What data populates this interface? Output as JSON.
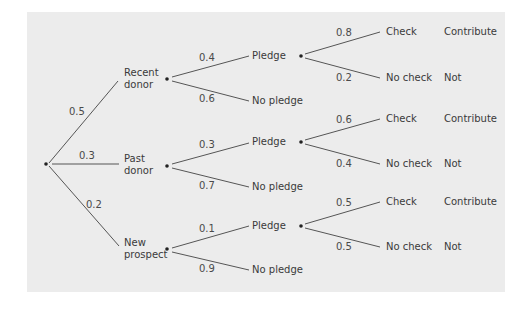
{
  "diagram": {
    "type": "probability-tree",
    "background_color": "#ececec",
    "line_color": "#555555",
    "level1": [
      {
        "label_line1": "Recent",
        "label_line2": "donor",
        "prob": "0.5"
      },
      {
        "label_line1": "Past",
        "label_line2": "donor",
        "prob": "0.3"
      },
      {
        "label_line1": "New",
        "label_line2": "prospect",
        "prob": "0.2"
      }
    ],
    "level2": [
      {
        "pledge": "Pledge",
        "pledge_prob": "0.4",
        "no_pledge": "No pledge",
        "no_pledge_prob": "0.6"
      },
      {
        "pledge": "Pledge",
        "pledge_prob": "0.3",
        "no_pledge": "No pledge",
        "no_pledge_prob": "0.7"
      },
      {
        "pledge": "Pledge",
        "pledge_prob": "0.1",
        "no_pledge": "No pledge",
        "no_pledge_prob": "0.9"
      }
    ],
    "level3": [
      {
        "check": "Check",
        "check_prob": "0.8",
        "check_outcome": "Contribute",
        "no_check": "No check",
        "no_check_prob": "0.2",
        "no_check_outcome": "Not"
      },
      {
        "check": "Check",
        "check_prob": "0.6",
        "check_outcome": "Contribute",
        "no_check": "No check",
        "no_check_prob": "0.4",
        "no_check_outcome": "Not"
      },
      {
        "check": "Check",
        "check_prob": "0.5",
        "check_outcome": "Contribute",
        "no_check": "No check",
        "no_check_prob": "0.5",
        "no_check_outcome": "Not"
      }
    ]
  }
}
